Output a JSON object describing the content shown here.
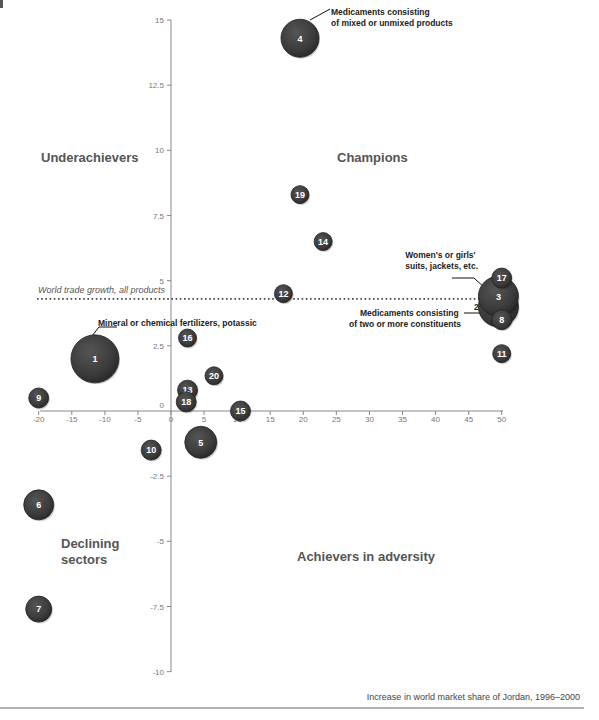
{
  "chart_data": {
    "type": "scatter",
    "subtype": "bubble",
    "title": "",
    "xlabel": "Increase in world market share of Jordan, 1996–2000",
    "ylabel": "",
    "xlim": [
      -20,
      50
    ],
    "ylim": [
      -10,
      15
    ],
    "x_ticks": [
      -20,
      -15,
      -10,
      -5,
      0,
      5,
      10,
      15,
      20,
      25,
      30,
      35,
      40,
      45,
      50
    ],
    "x_tick_labels": [
      "-20",
      "-15",
      "-10",
      "-5",
      "0",
      "5",
      "10",
      "15",
      "20",
      "25",
      "30",
      "35",
      "40",
      "45",
      "50"
    ],
    "y_ticks": [
      15,
      12.5,
      10,
      7.5,
      5,
      2.5,
      0,
      -2.5,
      -5,
      -7.5,
      -10
    ],
    "y_tick_labels": [
      "15",
      "12.5",
      "10",
      "7.5",
      "5",
      "2.5",
      "0",
      "-2.5",
      "-5",
      "-7.5",
      "-10"
    ],
    "grid": false,
    "reference_line": {
      "label": "World trade growth, all products",
      "y": 4.3,
      "style": "dotted"
    },
    "quadrant_labels": [
      {
        "name": "Underachievers",
        "position": "top-left"
      },
      {
        "name": "Champions",
        "position": "top-right"
      },
      {
        "name": "Declining sectors",
        "position": "bottom-left"
      },
      {
        "name": "Achievers in adversity",
        "position": "bottom-right"
      }
    ],
    "points": [
      {
        "id": "1",
        "x": -11.5,
        "y": 2.0,
        "size": 24
      },
      {
        "id": "2",
        "x": 49.5,
        "y": 4.0,
        "size": 20
      },
      {
        "id": "3",
        "x": 49.5,
        "y": 4.4,
        "size": 20
      },
      {
        "id": "4",
        "x": 19.5,
        "y": 14.3,
        "size": 19
      },
      {
        "id": "5",
        "x": 4.5,
        "y": -1.2,
        "size": 16
      },
      {
        "id": "6",
        "x": -20,
        "y": -3.6,
        "size": 15
      },
      {
        "id": "7",
        "x": -20,
        "y": -7.6,
        "size": 13
      },
      {
        "id": "8",
        "x": 50,
        "y": 3.5,
        "size": 10
      },
      {
        "id": "9",
        "x": -20,
        "y": 0.5,
        "size": 10
      },
      {
        "id": "10",
        "x": -3,
        "y": -1.5,
        "size": 10
      },
      {
        "id": "11",
        "x": 50,
        "y": 2.2,
        "size": 9
      },
      {
        "id": "12",
        "x": 17,
        "y": 4.5,
        "size": 9
      },
      {
        "id": "13",
        "x": 2.5,
        "y": 0.8,
        "size": 10
      },
      {
        "id": "14",
        "x": 23,
        "y": 6.5,
        "size": 9
      },
      {
        "id": "15",
        "x": 10.5,
        "y": 0.0,
        "size": 10
      },
      {
        "id": "16",
        "x": 2.5,
        "y": 2.8,
        "size": 9
      },
      {
        "id": "17",
        "x": 50,
        "y": 5.1,
        "size": 10
      },
      {
        "id": "18",
        "x": 2.3,
        "y": 0.35,
        "size": 10
      },
      {
        "id": "19",
        "x": 19.5,
        "y": 8.3,
        "size": 9
      },
      {
        "id": "20",
        "x": 6.5,
        "y": 1.35,
        "size": 9
      }
    ],
    "annotations": [
      {
        "point": "4",
        "text": [
          "Medicaments consisting",
          "of mixed or unmixed products"
        ]
      },
      {
        "point": "1",
        "text": [
          "Mineral or chemical fertilizers, potassic"
        ]
      },
      {
        "point": "3",
        "text": [
          "Women's or girls'",
          "suits, jackets, etc."
        ]
      },
      {
        "point": "2",
        "text": [
          "Medicaments consisting",
          "of two or more constituents"
        ]
      }
    ]
  },
  "colors": {
    "bubble": "#3a3a3a",
    "bubble_edge": "#222222",
    "axis": "#888888",
    "quadrant_label": "#555555"
  }
}
